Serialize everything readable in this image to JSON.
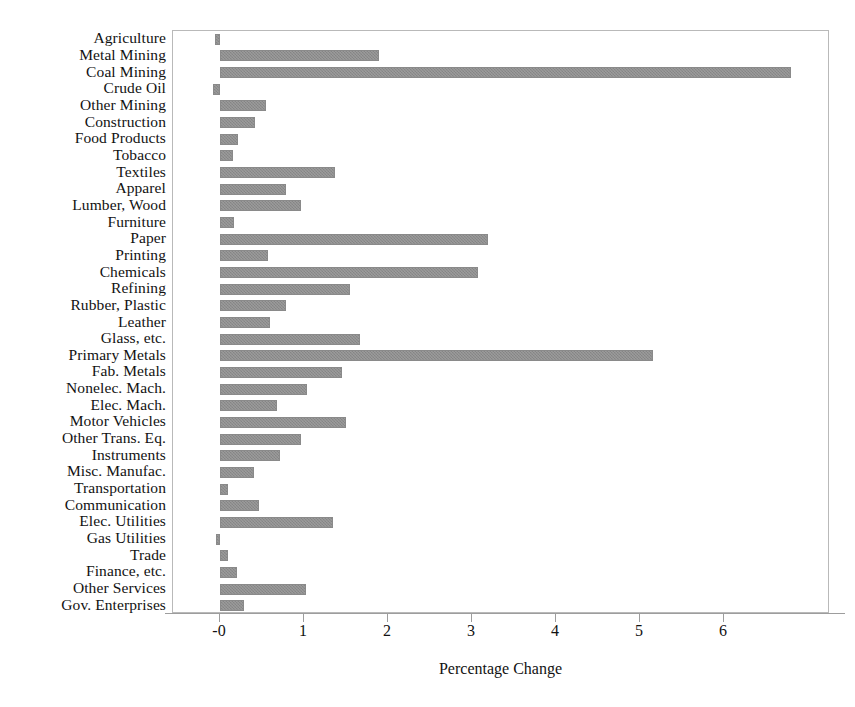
{
  "chart_data": {
    "type": "bar",
    "orientation": "horizontal",
    "title": "",
    "xlabel": "Percentage Change",
    "ylabel": "",
    "xlim": [
      -0.56,
      7.26
    ],
    "xticks": [
      0,
      1,
      2,
      3,
      4,
      5,
      6
    ],
    "xticklabels": [
      "-0",
      "1",
      "2",
      "3",
      "4",
      "5",
      "6"
    ],
    "grid": false,
    "legend": null,
    "bar_color": "#8c8c8c",
    "categories": [
      "Agriculture",
      "Metal Mining",
      "Coal Mining",
      "Crude Oil",
      "Other Mining",
      "Construction",
      "Food Products",
      "Tobacco",
      "Textiles",
      "Apparel",
      "Lumber, Wood",
      "Furniture",
      "Paper",
      "Printing",
      "Chemicals",
      "Refining",
      "Rubber, Plastic",
      "Leather",
      "Glass, etc.",
      "Primary Metals",
      "Fab. Metals",
      "Nonelec. Mach.",
      "Elec. Mach.",
      "Motor Vehicles",
      "Other Trans. Eq.",
      "Instruments",
      "Misc. Manufac.",
      "Transportation",
      "Communication",
      "Elec. Utilities",
      "Gas Utilities",
      "Trade",
      "Finance, etc.",
      "Other Services",
      "Gov. Enterprises"
    ],
    "values": [
      -0.06,
      1.89,
      6.8,
      -0.08,
      0.55,
      0.42,
      0.21,
      0.15,
      1.37,
      0.78,
      0.96,
      0.17,
      3.19,
      0.57,
      3.07,
      1.55,
      0.78,
      0.6,
      1.67,
      5.15,
      1.45,
      1.03,
      0.68,
      1.5,
      0.96,
      0.72,
      0.4,
      0.1,
      0.46,
      1.35,
      -0.05,
      0.09,
      0.2,
      1.02,
      0.28
    ]
  },
  "footnote": ""
}
